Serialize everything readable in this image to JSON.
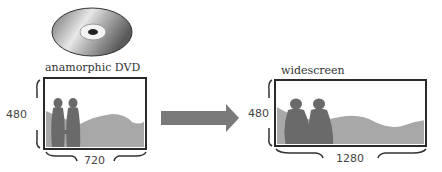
{
  "left": {
    "caption": "anamorphic DVD",
    "height_label": "480",
    "width_label": "720",
    "icon": "dvd-disc-icon"
  },
  "right": {
    "caption": "widescreen",
    "height_label": "480",
    "width_label": "1280"
  },
  "arrow": {
    "icon": "right-arrow-icon"
  },
  "colors": {
    "frame": "#2a2a2a",
    "hills": "#a8a8a8",
    "figures": "#6e6e6e",
    "arrow": "#7a7a7a",
    "disc": "#9a9a9a"
  }
}
